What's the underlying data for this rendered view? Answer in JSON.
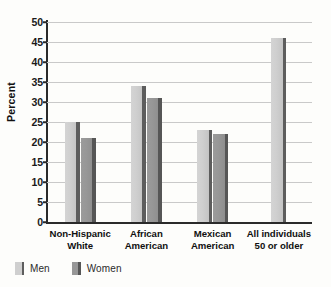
{
  "chart_data": {
    "type": "bar",
    "title": "",
    "xlabel": "",
    "ylabel": "Percent",
    "ylim": [
      0,
      50
    ],
    "yticks": [
      0,
      5,
      10,
      15,
      20,
      25,
      30,
      35,
      40,
      45,
      50
    ],
    "grid": true,
    "legend_position": "bottom-left",
    "categories": [
      "Non-Hispanic\nWhite",
      "African\nAmerican",
      "Mexican\nAmerican",
      "All individuals\n50 or older"
    ],
    "category_lines": [
      [
        "Non-Hispanic",
        "White"
      ],
      [
        "African",
        "American"
      ],
      [
        "Mexican",
        "American"
      ],
      [
        "All individuals",
        "50 or older"
      ]
    ],
    "series": [
      {
        "name": "Men",
        "values": [
          25,
          34,
          23,
          46
        ]
      },
      {
        "name": "Women",
        "values": [
          21,
          31,
          22,
          null
        ]
      }
    ],
    "colors": {
      "men": "#cfcfcf",
      "women": "#979797",
      "men_side": "#5d5d5d",
      "women_side": "#565656",
      "gridline": "#c9c9c9",
      "axis": "#2a2a2a",
      "background": "#fdfdfb",
      "text": "#1a1a1a"
    }
  },
  "legend": {
    "items": [
      {
        "label": "Men",
        "key": "men"
      },
      {
        "label": "Women",
        "key": "women"
      }
    ]
  }
}
